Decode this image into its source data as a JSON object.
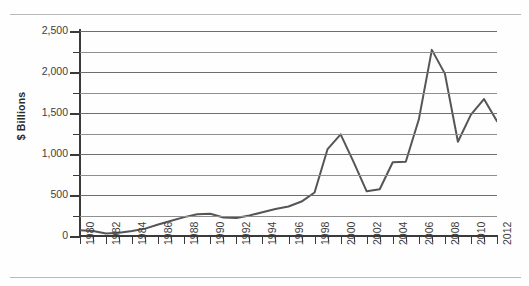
{
  "chart_data": {
    "type": "line",
    "title": "",
    "xlabel": "",
    "ylabel": "$ Billions",
    "xlim": [
      1980,
      2012
    ],
    "ylim": [
      0,
      2500
    ],
    "grid": true,
    "legend": "none",
    "y_major_ticks": [
      0,
      500,
      1000,
      1500,
      2000,
      2500
    ],
    "y_major_tick_labels": [
      "0",
      "500",
      "1,000",
      "1,500",
      "2,000",
      "2,500"
    ],
    "y_minor_ticks": [
      250,
      750,
      1250,
      1750,
      2250
    ],
    "x_tick_labels": [
      "1980",
      "1982",
      "1984",
      "1986",
      "1988",
      "1990",
      "1992",
      "1994",
      "1996",
      "1998",
      "2000",
      "2002",
      "2004",
      "2006",
      "2008",
      "2010",
      "2012"
    ],
    "line_color": "#555555",
    "grid_color": "#8f8f8f",
    "x": [
      1980,
      1981,
      1982,
      1983,
      1984,
      1985,
      1986,
      1987,
      1988,
      1989,
      1990,
      1991,
      1992,
      1993,
      1994,
      1995,
      1996,
      1997,
      1998,
      1999,
      2000,
      2001,
      2002,
      2003,
      2004,
      2005,
      2006,
      2007,
      2008,
      2009,
      2010,
      2011,
      2012
    ],
    "values": [
      70,
      60,
      30,
      40,
      60,
      90,
      140,
      185,
      230,
      265,
      272,
      225,
      220,
      250,
      290,
      330,
      360,
      420,
      530,
      1060,
      1240,
      900,
      545,
      570,
      900,
      905,
      1420,
      2270,
      1980,
      1150,
      1480,
      1670,
      1400
    ],
    "series": [
      {
        "name": "$ Billions",
        "values": [
          70,
          60,
          30,
          40,
          60,
          90,
          140,
          185,
          230,
          265,
          272,
          225,
          220,
          250,
          290,
          330,
          360,
          420,
          530,
          1060,
          1240,
          900,
          545,
          570,
          900,
          905,
          1420,
          2270,
          1980,
          1150,
          1480,
          1670,
          1400
        ]
      }
    ],
    "annotations": []
  }
}
